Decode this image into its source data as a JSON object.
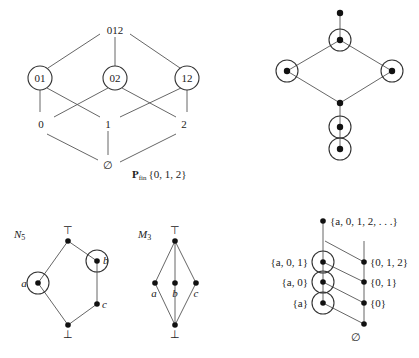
{
  "powerset": {
    "caption_main": "P",
    "caption_sub": "fin",
    "caption_set": "{0, 1, 2}",
    "nodes": {
      "top": "012",
      "n01": "01",
      "n02": "02",
      "n12": "12",
      "n0": "0",
      "n1": "1",
      "n2": "2",
      "bottom": "∅"
    },
    "circled": [
      "01",
      "02",
      "12"
    ]
  },
  "chain_lattice": {
    "description": "unlabelled lattice with circled elements",
    "circled_count": 5
  },
  "n5": {
    "title": "N",
    "title_sub": "5",
    "top": "⊤",
    "bottom": "⊥",
    "a": "a",
    "b": "b",
    "c": "c"
  },
  "m3": {
    "title": "M",
    "title_sub": "3",
    "top": "⊤",
    "bottom": "⊥",
    "a": "a",
    "b": "b",
    "c": "c"
  },
  "infinite": {
    "top": "{a, 0, 1, 2, . . .}",
    "left": [
      "{a, 0, 1}",
      "{a, 0}",
      "{a}"
    ],
    "right": [
      "{0, 1, 2}",
      "{0, 1}",
      "{0}"
    ],
    "bottom": "∅"
  }
}
